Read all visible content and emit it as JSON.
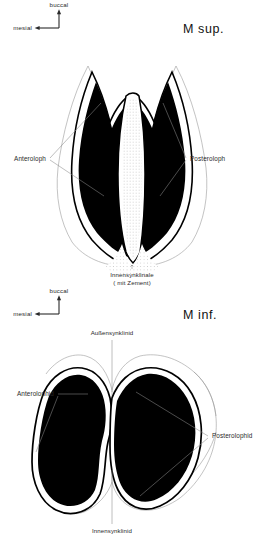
{
  "figure": {
    "caption_language": "de",
    "background_color": "#ffffff",
    "ink_color": "#000000",
    "leader_line_color": "#8a8a8a",
    "enamel_fill": "#000000",
    "cement_fill": "#f2f2f2"
  },
  "panels": [
    {
      "id": "upper-molar",
      "title": "M sup.",
      "orientation": {
        "up_label": "buccal",
        "left_label": "mesial"
      },
      "labels": {
        "left": "Anteroloph",
        "right": "Posteroloph",
        "bottom_line1": "Innensynklinale",
        "bottom_line2": "( mit Zement)"
      }
    },
    {
      "id": "lower-molar",
      "title": "M inf.",
      "orientation": {
        "up_label": "buccal",
        "left_label": "mesial"
      },
      "labels": {
        "top": "Außensynklinid",
        "left": "Anterolophid",
        "right": "Posterolophid",
        "bottom": "Innensynklinid"
      }
    }
  ],
  "icons": {
    "up_arrow": "arrow-up-icon",
    "left_arrow": "arrow-left-icon"
  }
}
